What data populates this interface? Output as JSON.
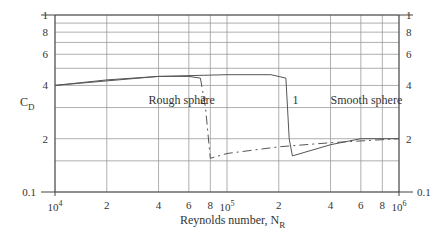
{
  "chart_data": {
    "type": "line",
    "title": "",
    "xlabel": "Reynolds number, N_R",
    "xlabel_main": "Reynolds number, N",
    "xlabel_sub": "R",
    "ylabel": "C_D",
    "ylabel_main": "C",
    "ylabel_sub": "D",
    "x_scale": "log",
    "y_scale": "log",
    "xlim": [
      10000,
      1000000
    ],
    "ylim": [
      0.1,
      1
    ],
    "grid": true,
    "x_ticks": [
      {
        "value": 10000,
        "label": "10",
        "sup": "4"
      },
      {
        "value": 20000,
        "label": "2"
      },
      {
        "value": 40000,
        "label": "4"
      },
      {
        "value": 60000,
        "label": "6"
      },
      {
        "value": 80000,
        "label": "8"
      },
      {
        "value": 100000,
        "label": "10",
        "sup": "5"
      },
      {
        "value": 200000,
        "label": "2"
      },
      {
        "value": 400000,
        "label": "4"
      },
      {
        "value": 600000,
        "label": "6"
      },
      {
        "value": 800000,
        "label": "8"
      },
      {
        "value": 1000000,
        "label": "10",
        "sup": "6"
      }
    ],
    "y_ticks": [
      {
        "value": 1,
        "label": "1"
      },
      {
        "value": 0.8,
        "label": "8"
      },
      {
        "value": 0.6,
        "label": "6"
      },
      {
        "value": 0.4,
        "label": "4"
      },
      {
        "value": 0.2,
        "label": "2"
      },
      {
        "value": 0.1,
        "label": "0.1"
      }
    ],
    "y_gridlines": [
      1,
      0.9,
      0.8,
      0.7,
      0.6,
      0.5,
      0.4,
      0.3,
      0.2,
      0.15,
      0.1
    ],
    "series": [
      {
        "name": "Rough sphere",
        "marker_label": "2",
        "style": "solid then dashed after drop",
        "x": [
          10000,
          20000,
          40000,
          60000,
          70000,
          75000,
          80000,
          100000,
          200000,
          400000,
          1000000
        ],
        "y": [
          0.4,
          0.43,
          0.45,
          0.45,
          0.44,
          0.3,
          0.155,
          0.165,
          0.18,
          0.19,
          0.2
        ]
      },
      {
        "name": "Smooth sphere",
        "marker_label": "1",
        "style": "solid",
        "x": [
          10000,
          40000,
          100000,
          180000,
          220000,
          230000,
          240000,
          400000,
          600000,
          1000000
        ],
        "y": [
          0.4,
          0.45,
          0.46,
          0.46,
          0.44,
          0.2,
          0.16,
          0.185,
          0.2,
          0.2
        ]
      }
    ],
    "annotations": [
      {
        "text": "Rough sphere",
        "x": 35000,
        "y": 0.33
      },
      {
        "text": "2",
        "x": 70000,
        "y": 0.33
      },
      {
        "text": "1",
        "x": 240000,
        "y": 0.33
      },
      {
        "text": "Smooth sphere",
        "x": 400000,
        "y": 0.33
      }
    ]
  }
}
